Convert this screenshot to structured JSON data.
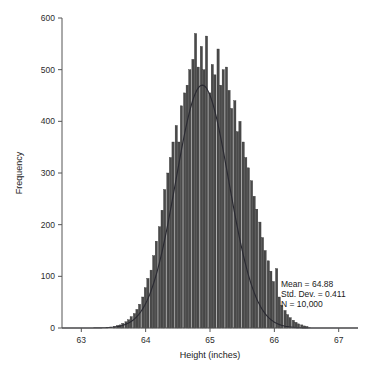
{
  "figure": {
    "background": "#ffffff",
    "bar_color": "#4a4a4a",
    "bar_edge_color": "#2e2e2e",
    "curve_color": "#2a2a32",
    "axis_color": "#555555",
    "partial_title": ""
  },
  "annotation": {
    "mean_label": "Mean = 64.88",
    "std_label": "Std. Dev. = 0.411",
    "n_label": "N = 10,000"
  },
  "chart_data": {
    "type": "bar",
    "title": "",
    "xlabel": "Height (inches)",
    "ylabel": "Frequency",
    "xlim": [
      62.7,
      67.3
    ],
    "ylim": [
      0,
      600
    ],
    "xticks": [
      63,
      64,
      65,
      66,
      67
    ],
    "xtick_labels": [
      "63",
      "64",
      "65",
      "66",
      "67"
    ],
    "yticks": [
      0,
      100,
      200,
      300,
      400,
      500,
      600
    ],
    "ytick_labels": [
      "0",
      "100",
      "200",
      "300",
      "400",
      "500",
      "600"
    ],
    "grid": false,
    "legend": null,
    "bin_width": 0.0437,
    "bin_centers": [
      63.52,
      63.57,
      63.61,
      63.65,
      63.7,
      63.74,
      63.78,
      63.83,
      63.87,
      63.91,
      63.96,
      64.0,
      64.04,
      64.09,
      64.13,
      64.17,
      64.22,
      64.26,
      64.3,
      64.35,
      64.39,
      64.43,
      64.48,
      64.52,
      64.56,
      64.61,
      64.65,
      64.69,
      64.74,
      64.78,
      64.82,
      64.87,
      64.91,
      64.95,
      65.0,
      65.04,
      65.08,
      65.13,
      65.17,
      65.21,
      65.26,
      65.3,
      65.34,
      65.39,
      65.43,
      65.47,
      65.52,
      65.56,
      65.6,
      65.65,
      65.69,
      65.73,
      65.78,
      65.82,
      65.86,
      65.91,
      65.95,
      65.99,
      66.04,
      66.08,
      66.12,
      66.17,
      66.21,
      66.25,
      66.3,
      66.34,
      66.38,
      66.43,
      66.47,
      66.51
    ],
    "values": [
      3,
      5,
      6,
      9,
      12,
      16,
      22,
      28,
      36,
      46,
      60,
      78,
      96,
      112,
      140,
      168,
      196,
      228,
      268,
      300,
      330,
      360,
      392,
      360,
      430,
      455,
      470,
      500,
      520,
      570,
      505,
      545,
      500,
      565,
      455,
      510,
      490,
      540,
      470,
      500,
      505,
      460,
      425,
      440,
      380,
      400,
      360,
      330,
      310,
      285,
      255,
      230,
      205,
      175,
      150,
      130,
      110,
      90,
      115,
      60,
      44,
      34,
      26,
      20,
      15,
      11,
      8,
      6,
      4,
      3
    ],
    "overlay": {
      "type": "normal-curve",
      "mean": 64.88,
      "std": 0.411,
      "n": 10000,
      "peak_value": 470
    }
  }
}
